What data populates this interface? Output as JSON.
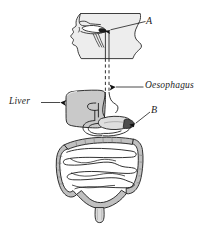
{
  "figure": {
    "type": "labelled-biology-diagram",
    "background_color": "#ffffff",
    "line_color": "#1c1c1c",
    "organ_fill_color": "#c9c9c9",
    "organ_fill_light": "#e2e2e2",
    "arrow_color": "#111111"
  },
  "labels": {
    "a": "A",
    "oesophagus": "Oesophagus",
    "liver": "Liver",
    "b": "B"
  },
  "parts": {
    "head_section": "head-neck-sagittal-section",
    "pharynx_marker": "pharynx-epiglottis-arrow",
    "oesophagus_tube": "oesophagus-dashed-tube",
    "liver_organ": "liver",
    "stomach_organ": "stomach",
    "duodenum": "duodenum",
    "small_intestine": "small-intestine",
    "large_intestine": "large-intestine",
    "rectum": "rectum"
  }
}
